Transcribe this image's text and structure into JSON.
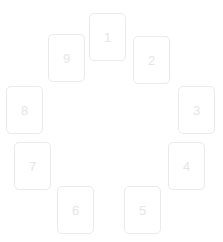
{
  "scene": {
    "title": "Numbered cards arranged in a circle",
    "background_color": "#ffffff",
    "card_border_color": "#ebebeb",
    "card_face_color": "#ffffff",
    "number_color": "#e6e6e6",
    "card_width": 37,
    "card_height": 48,
    "card_count": 9
  },
  "cards": [
    {
      "label": "1",
      "x": 89,
      "y": 13
    },
    {
      "label": "2",
      "x": 133,
      "y": 36
    },
    {
      "label": "3",
      "x": 178,
      "y": 86
    },
    {
      "label": "4",
      "x": 168,
      "y": 142
    },
    {
      "label": "5",
      "x": 124,
      "y": 186
    },
    {
      "label": "6",
      "x": 57,
      "y": 186
    },
    {
      "label": "7",
      "x": 14,
      "y": 142
    },
    {
      "label": "8",
      "x": 6,
      "y": 86
    },
    {
      "label": "9",
      "x": 48,
      "y": 34
    }
  ]
}
